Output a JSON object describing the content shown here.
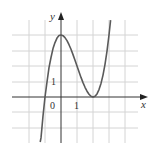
{
  "figure": {
    "type": "function-graph",
    "function": "f(x) = (x+1)(x-2)^2",
    "axes": {
      "x_label": "x",
      "y_label": "y",
      "origin_label": "0",
      "x_tick_label": "1",
      "y_tick_label": "1"
    },
    "grid": {
      "x_range": [
        -2,
        4
      ],
      "y_range": [
        -3,
        4
      ],
      "step": 1
    },
    "colors": {
      "grid": "#cfcfcf",
      "axis": "#333333",
      "curve": "#555555"
    },
    "key_points": [
      {
        "label": "local-max",
        "x": 0,
        "y": 4
      },
      {
        "label": "local-min",
        "x": 2,
        "y": 0
      },
      {
        "label": "root",
        "x": -1,
        "y": 0
      }
    ]
  }
}
